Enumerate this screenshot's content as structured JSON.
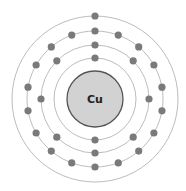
{
  "element": {
    "symbol": "Cu"
  },
  "center": {
    "x": 95,
    "y": 99
  },
  "nucleus": {
    "radius": 28,
    "fill": "#d2d2d2",
    "stroke": "#555555"
  },
  "colors": {
    "orbit": "#b4b4b4",
    "electron": "#7a7a7a"
  },
  "electron_radius": 3.6,
  "shells": [
    {
      "name": "shell-1",
      "radius": 41,
      "electrons": 2
    },
    {
      "name": "shell-2",
      "radius": 54,
      "electrons": 8
    },
    {
      "name": "shell-3",
      "radius": 68,
      "electrons": 18
    },
    {
      "name": "shell-4",
      "radius": 83,
      "electrons": 1
    }
  ]
}
